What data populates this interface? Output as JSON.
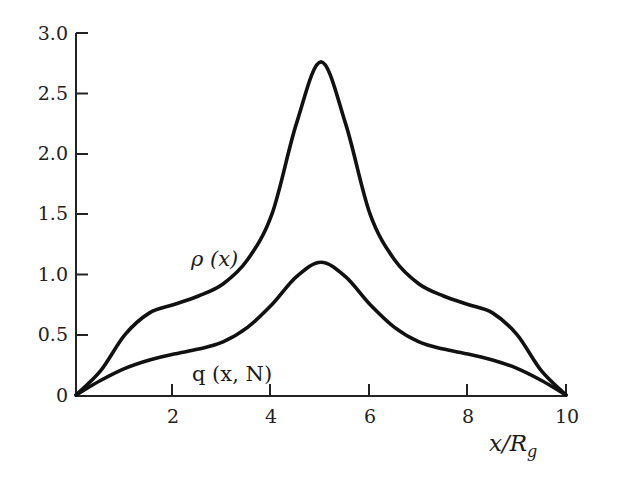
{
  "chart_data": {
    "type": "line",
    "title": "",
    "xlabel": "x/R_g",
    "ylabel": "",
    "xlim": [
      0,
      10
    ],
    "ylim": [
      0,
      3.0
    ],
    "grid": false,
    "legend": "none (curves labeled inline)",
    "x_ticks": [
      "2",
      "4",
      "6",
      "8",
      "10"
    ],
    "y_ticks": [
      "0",
      "0.5",
      "1.0",
      "1.5",
      "2.0",
      "2.5",
      "3.0"
    ],
    "x": [
      0,
      0.5,
      1,
      1.5,
      2,
      2.5,
      3,
      3.5,
      4,
      4.5,
      5,
      5.5,
      6,
      6.5,
      7,
      7.5,
      8,
      8.5,
      9,
      9.5,
      10
    ],
    "series": [
      {
        "name": "ρ (x)",
        "values": [
          0,
          0.2,
          0.5,
          0.68,
          0.75,
          0.82,
          0.92,
          1.12,
          1.5,
          2.25,
          2.76,
          2.25,
          1.5,
          1.12,
          0.92,
          0.82,
          0.75,
          0.68,
          0.5,
          0.2,
          0
        ]
      },
      {
        "name": "q (x, N)",
        "values": [
          0,
          0.12,
          0.22,
          0.29,
          0.34,
          0.38,
          0.44,
          0.56,
          0.75,
          0.98,
          1.1,
          0.98,
          0.75,
          0.56,
          0.44,
          0.38,
          0.34,
          0.29,
          0.22,
          0.12,
          0
        ]
      }
    ],
    "annotations": [
      {
        "text": "ρ (x)",
        "x": 2.4,
        "y": 1.1
      },
      {
        "text": "q (x, N)",
        "x": 2.6,
        "y": 0.1
      }
    ]
  },
  "labels": {
    "y_ticks": [
      "0",
      "0.5",
      "1.0",
      "1.5",
      "2.0",
      "2.5",
      "3.0"
    ],
    "x_ticks": [
      "2",
      "4",
      "6",
      "8",
      "10"
    ],
    "x_axis_title": "x/R",
    "x_axis_sub": "g",
    "rho_label": "ρ (x)",
    "q_label": "q (x, N)"
  },
  "colors": {
    "line": "#111111",
    "axis": "#222222",
    "background": "#ffffff"
  }
}
